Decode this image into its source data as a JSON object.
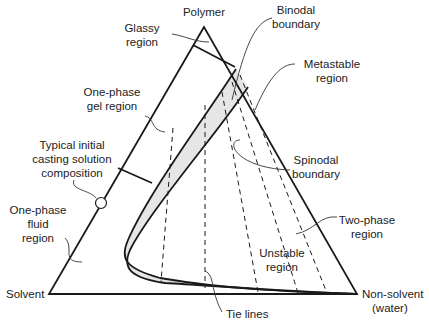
{
  "diagram": {
    "vertices": {
      "top": "Polymer",
      "left": "Solvent",
      "right_line1": "Non-solvent",
      "right_line2": "(water)"
    },
    "labels": {
      "glassy": [
        "Glassy",
        "region"
      ],
      "binodal": [
        "Binodal",
        "boundary"
      ],
      "metastable": [
        "Metastable",
        "region"
      ],
      "gel": [
        "One-phase",
        "gel region"
      ],
      "casting": [
        "Typical initial",
        "casting solution",
        "composition"
      ],
      "spinodal": [
        "Spinodal",
        "boundary"
      ],
      "fluid": [
        "One-phase",
        "fluid",
        "region"
      ],
      "two_phase": [
        "Two-phase",
        "region"
      ],
      "unstable": [
        "Unstable",
        "region"
      ],
      "tie_lines": "Tie lines"
    },
    "colors": {
      "line": "#1a1a1a",
      "metastable_fill": "#e6e6e6",
      "text": "#222222"
    }
  }
}
